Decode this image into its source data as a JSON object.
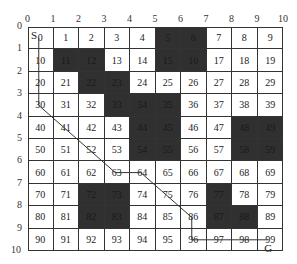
{
  "diagram": {
    "type": "grid-path-planning",
    "rows": 10,
    "cols": 10,
    "x_axis_ticks": [
      "0",
      "1",
      "2",
      "3",
      "4",
      "5",
      "6",
      "7",
      "8",
      "9",
      "10"
    ],
    "y_axis_ticks": [
      "0",
      "1",
      "2",
      "3",
      "4",
      "5",
      "6",
      "7",
      "8",
      "9",
      "10"
    ],
    "cells": [
      "0",
      "1",
      "2",
      "3",
      "4",
      "5",
      "6",
      "7",
      "8",
      "9",
      "10",
      "11",
      "12",
      "13",
      "14",
      "15",
      "16",
      "17",
      "18",
      "19",
      "20",
      "21",
      "22",
      "23",
      "24",
      "25",
      "26",
      "27",
      "28",
      "29",
      "30",
      "31",
      "32",
      "33",
      "34",
      "35",
      "36",
      "37",
      "38",
      "39",
      "40",
      "41",
      "42",
      "43",
      "44",
      "45",
      "46",
      "47",
      "48",
      "49",
      "50",
      "51",
      "52",
      "53",
      "54",
      "55",
      "56",
      "57",
      "58",
      "59",
      "60",
      "61",
      "62",
      "63",
      "64",
      "65",
      "66",
      "67",
      "68",
      "69",
      "70",
      "71",
      "72",
      "73",
      "74",
      "75",
      "76",
      "77",
      "78",
      "79",
      "80",
      "81",
      "82",
      "83",
      "84",
      "85",
      "86",
      "87",
      "88",
      "89",
      "90",
      "91",
      "92",
      "93",
      "94",
      "95",
      "96",
      "97",
      "98",
      "99"
    ],
    "obstacles": [
      5,
      6,
      11,
      12,
      15,
      16,
      22,
      23,
      33,
      34,
      35,
      44,
      45,
      48,
      49,
      54,
      55,
      58,
      59,
      72,
      73,
      77,
      82,
      83,
      87,
      88
    ],
    "path": [
      0,
      10,
      20,
      30,
      41,
      52,
      63,
      64,
      75,
      86,
      96,
      97,
      98,
      99
    ],
    "start_label": "S",
    "goal_label": "G",
    "colors": {
      "obstacle": "#303030",
      "free": "#ffffff",
      "grid_line": "#333333",
      "path_line": "#333333"
    }
  }
}
